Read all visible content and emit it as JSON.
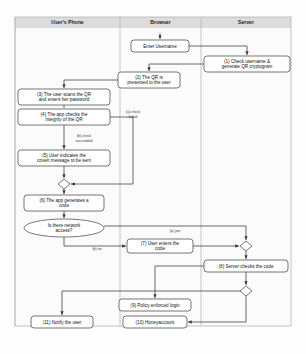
{
  "diagram": {
    "lanes": [
      {
        "id": "phone",
        "label": "User's Phone",
        "x": 15,
        "w": 105
      },
      {
        "id": "browser",
        "label": "Browser",
        "x": 120,
        "w": 81
      },
      {
        "id": "server",
        "label": "Server",
        "x": 201,
        "w": 90
      }
    ],
    "lane_band": {
      "y": 17,
      "h": 11
    },
    "lane_body": {
      "y": 28,
      "h": 298
    },
    "nodes": [
      {
        "id": "enter-username",
        "lane": "browser",
        "shape": "box",
        "cx": 160,
        "cy": 46,
        "w": 58,
        "h": 12,
        "lines": [
          "Enter Username"
        ]
      },
      {
        "id": "check-username",
        "lane": "server",
        "shape": "box",
        "cx": 247,
        "cy": 64,
        "w": 86,
        "h": 16,
        "lines": [
          "(1) Check username &",
          "generate QR cryptogram"
        ]
      },
      {
        "id": "qr-presented",
        "lane": "browser",
        "shape": "box",
        "cx": 149,
        "cy": 80,
        "w": 62,
        "h": 16,
        "lines": [
          "(2) The QR is",
          "presented to the user"
        ]
      },
      {
        "id": "scan-qr",
        "lane": "phone",
        "shape": "box",
        "cx": 64,
        "cy": 97,
        "w": 92,
        "h": 16,
        "lines": [
          "(3) The user scans the QR",
          "and enters her password"
        ]
      },
      {
        "id": "check-integrity",
        "lane": "phone",
        "shape": "box",
        "cx": 64,
        "cy": 117,
        "w": 92,
        "h": 16,
        "lines": [
          "(4) The app checks the",
          "integrity of the QR"
        ]
      },
      {
        "id": "covert-message",
        "lane": "phone",
        "shape": "box",
        "cx": 64,
        "cy": 158,
        "w": 92,
        "h": 16,
        "lines": [
          "(5) User indicates the",
          "covert message to be sent"
        ]
      },
      {
        "id": "merge-diamond",
        "lane": "phone",
        "shape": "diamond",
        "cx": 64,
        "cy": 184,
        "w": 12,
        "h": 10,
        "lines": []
      },
      {
        "id": "generate-code",
        "lane": "phone",
        "shape": "box",
        "cx": 64,
        "cy": 203,
        "w": 80,
        "h": 16,
        "lines": [
          "(6) The app generates a",
          "code"
        ]
      },
      {
        "id": "network-access",
        "lane": "phone",
        "shape": "ellipse",
        "cx": 64,
        "cy": 228,
        "w": 80,
        "h": 18,
        "lines": [
          "Is there network",
          "access?"
        ]
      },
      {
        "id": "enter-code",
        "lane": "browser",
        "shape": "box",
        "cx": 160,
        "cy": 246,
        "w": 66,
        "h": 14,
        "lines": [
          "(7) User enters the",
          "code"
        ]
      },
      {
        "id": "join-diamond",
        "lane": "server",
        "shape": "diamond",
        "cx": 246,
        "cy": 246,
        "w": 12,
        "h": 10,
        "lines": []
      },
      {
        "id": "server-checks",
        "lane": "server",
        "shape": "box",
        "cx": 246,
        "cy": 266,
        "w": 84,
        "h": 12,
        "lines": [
          "(8) Server checks the code"
        ]
      },
      {
        "id": "decide-diamond",
        "lane": "server",
        "shape": "diamond",
        "cx": 246,
        "cy": 291,
        "w": 12,
        "h": 10,
        "lines": []
      },
      {
        "id": "policy-login",
        "lane": "browser",
        "shape": "box",
        "cx": 155,
        "cy": 305,
        "w": 72,
        "h": 12,
        "lines": [
          "(9) Policy enforced login"
        ]
      },
      {
        "id": "honeyaccount",
        "lane": "browser",
        "shape": "box",
        "cx": 155,
        "cy": 322,
        "w": 64,
        "h": 12,
        "lines": [
          "(10) Honeyaccount"
        ]
      },
      {
        "id": "notify-user",
        "lane": "phone",
        "shape": "box",
        "cx": 62,
        "cy": 322,
        "w": 62,
        "h": 12,
        "lines": [
          "(11) Notify the user"
        ]
      }
    ],
    "edge_labels": [
      {
        "id": "check-failed",
        "text": "(a) check",
        "x": 133,
        "y": 113
      },
      {
        "id": "check-failed-2",
        "text": "failed",
        "x": 133,
        "y": 118
      },
      {
        "id": "check-succeeded",
        "text": "(b) check",
        "x": 84,
        "y": 137
      },
      {
        "id": "check-succeeded-2",
        "text": "succeeded",
        "x": 84,
        "y": 142
      },
      {
        "id": "yes-label",
        "text": "(a) yes",
        "x": 175,
        "y": 232
      },
      {
        "id": "no-label",
        "text": "(b) no",
        "x": 97,
        "y": 250
      }
    ],
    "colors": {
      "lane_band": "#dcdcdc",
      "lane_body": "#fbfbfb",
      "node_stroke": "#4a4a4a",
      "flow_stroke": "#3a3a3a",
      "text": "#111111"
    }
  }
}
